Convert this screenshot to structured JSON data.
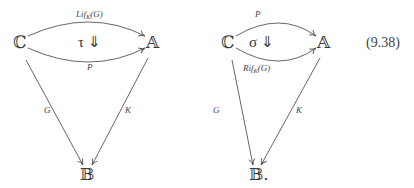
{
  "equation_number": "(9.38)",
  "diagrams": [
    {
      "objects": {
        "source": "ℂ",
        "target": "𝔸",
        "bottom": "𝔹"
      },
      "arrows": {
        "top": {
          "label_main": "Lif",
          "label_sub": "K",
          "label_tail": "(G)"
        },
        "bottom_curve": {
          "label": "P"
        },
        "left": {
          "label": "G"
        },
        "right": {
          "label": "K"
        }
      },
      "two_cell": "τ ⇓"
    },
    {
      "objects": {
        "source": "ℂ",
        "target": "𝔸",
        "bottom": "𝔹."
      },
      "arrows": {
        "top": {
          "label": "P"
        },
        "bottom_curve": {
          "label_main": "Rif",
          "label_sub": "K",
          "label_tail": "(G)"
        },
        "left": {
          "label": "G"
        },
        "right": {
          "label": "K"
        }
      },
      "two_cell": "σ ⇓"
    }
  ]
}
